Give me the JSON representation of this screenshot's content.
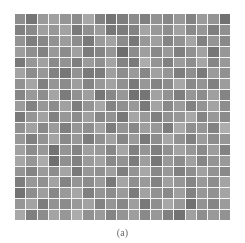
{
  "figure": {
    "caption": "(a)",
    "panel_label": "(a)",
    "background_color": "#ffffff",
    "grid_line_color": "#f4f4f4",
    "panel_bounds": {
      "x": 15,
      "y": 14,
      "width": 215,
      "height": 206
    }
  },
  "chart_data": {
    "type": "heatmap",
    "title": "(a)",
    "subtitle": "",
    "xlabel": "",
    "ylabel": "",
    "colormap": "gray",
    "grid": true,
    "legend": "none",
    "rows": 19,
    "cols": 19,
    "value_range": [
      0,
      255
    ],
    "xlim": [
      0,
      19
    ],
    "ylim": [
      0,
      19
    ],
    "x_tick_labels": [],
    "y_tick_labels": [],
    "annotations": [],
    "cell_hex": [
      [
        "#9b9b9b",
        "#808080",
        "#a8a8a8",
        "#b0b0b0",
        "#a3a3a3",
        "#9a9a9a",
        "#b7b7b7",
        "#8e8e8e",
        "#7f7f7f",
        "#8a8a8a",
        "#999999",
        "#8c8c8c",
        "#a0a0a0",
        "#949494",
        "#a6a6a6",
        "#8f8f8f",
        "#a9a9a9",
        "#a2a2a2",
        "#7c7c7c"
      ],
      [
        "#8d8d8d",
        "#969696",
        "#afafaf",
        "#a5a5a5",
        "#b2b2b2",
        "#868686",
        "#9d9d9d",
        "#aaaaaa",
        "#828282",
        "#888888",
        "#909090",
        "#b4b4b4",
        "#a7a7a7",
        "#9c9c9c",
        "#b1b1b1",
        "#979797",
        "#a4a4a4",
        "#8b8b8b",
        "#9e9e9e"
      ],
      [
        "#a1a1a1",
        "#8a8a8a",
        "#949494",
        "#9f9f9f",
        "#ababab",
        "#9b9b9b",
        "#858585",
        "#a9a9a9",
        "#b3b3b3",
        "#989898",
        "#838383",
        "#a6a6a6",
        "#adadad",
        "#929292",
        "#a0a0a0",
        "#b5b5b5",
        "#8e8e8e",
        "#a3a3a3",
        "#969696"
      ],
      [
        "#acacac",
        "#9d9d9d",
        "#8f8f8f",
        "#a7a7a7",
        "#999999",
        "#b0b0b0",
        "#878787",
        "#929292",
        "#a4a4a4",
        "#787878",
        "#9a9a9a",
        "#aeaeae",
        "#959595",
        "#a8a8a8",
        "#8c8c8c",
        "#9f9f9f",
        "#b2b2b2",
        "#818181",
        "#a5a5a5"
      ],
      [
        "#848484",
        "#a5a5a5",
        "#b1b1b1",
        "#979797",
        "#a0a0a0",
        "#8b8b8b",
        "#a9a9a9",
        "#9e9e9e",
        "#b4b4b4",
        "#909090",
        "#868686",
        "#bcbcbc",
        "#a2a2a2",
        "#8d8d8d",
        "#aaaaaa",
        "#9c9c9c",
        "#b6b6b6",
        "#939393",
        "#a7a7a7"
      ],
      [
        "#b3b3b3",
        "#9a9a9a",
        "#a6a6a6",
        "#8e8e8e",
        "#828282",
        "#a1a1a1",
        "#858585",
        "#898989",
        "#afafaf",
        "#9b9b9b",
        "#a8a8a8",
        "#949494",
        "#b0b0b0",
        "#a4a4a4",
        "#8a8a8a",
        "#9d9d9d",
        "#868686",
        "#a9a9a9",
        "#9f9f9f"
      ],
      [
        "#a0a0a0",
        "#b5b5b5",
        "#8c8c8c",
        "#a3a3a3",
        "#989898",
        "#adadad",
        "#919191",
        "#a7a7a7",
        "#b2b2b2",
        "#9e9e9e",
        "#848484",
        "#a5a5a5",
        "#8f8f8f",
        "#9a9a9a",
        "#b7b7b7",
        "#969696",
        "#a2a2a2",
        "#8d8d8d",
        "#abab ab"
      ],
      [
        "#939393",
        "#a8a8a8",
        "#9c9c9c",
        "#b4b4b4",
        "#878787",
        "#9f9f9f",
        "#aeaeae",
        "#828282",
        "#959595",
        "#a6a6a6",
        "#7d7d7d",
        "#808080",
        "#b1b1b1",
        "#a0a0a0",
        "#8b8b8b",
        "#a4a4a4",
        "#999999",
        "#afafaf",
        "#919191"
      ],
      [
        "#aaaaaa",
        "#8f8f8f",
        "#a5a5a5",
        "#999999",
        "#b0b0b0",
        "#8a8a8a",
        "#a2a2a2",
        "#b6b6b6",
        "#909090",
        "#9d9d9d",
        "#a7a7a7",
        "#858585",
        "#b3b3b3",
        "#969696",
        "#a9a9a9",
        "#8e8e8e",
        "#a1a1a1",
        "#b2b2b2",
        "#9b9b9b"
      ],
      [
        "#868686",
        "#a3a3a3",
        "#b2b2b2",
        "#8d8d8d",
        "#a6a6a6",
        "#9a9a9a",
        "#aeaeae",
        "#949494",
        "#a0a0a0",
        "#838383",
        "#b5b5b5",
        "#a8a8a8",
        "#8c8c8c",
        "#9f9f9f",
        "#a5a5a5",
        "#b8b8b8",
        "#929292",
        "#a7a7a7",
        "#989898"
      ],
      [
        "#9e9e9e",
        "#b0b0b0",
        "#969696",
        "#a9a9a9",
        "#8b8b8b",
        "#a4a4a4",
        "#9c9c9c",
        "#b3b3b3",
        "#888888",
        "#a1a1a1",
        "#959595",
        "#adadad",
        "#a6a6a6",
        "#8a8a8a",
        "#b9b9b9",
        "#9d9d9d",
        "#a3a3a3",
        "#8f8f8f",
        "#bdbdbd"
      ],
      [
        "#a7a7a7",
        "#8c8c8c",
        "#a1a1a1",
        "#b4b4b4",
        "#979797",
        "#a5a5a5",
        "#898989",
        "#9f9f9f",
        "#b1b1b1",
        "#939393",
        "#a9a9a9",
        "#848484",
        "#9b9b9b",
        "#b6b6b6",
        "#a0a0a0",
        "#8e8e8e",
        "#aaaaaa",
        "#9a9a9a",
        "#a4a4a4"
      ],
      [
        "#b1b1b1",
        "#999999",
        "#a6a6a6",
        "#7e7e7e",
        "#a2a2a2",
        "#909090",
        "#adadad",
        "#a8a8a8",
        "#959595",
        "#b5b5b5",
        "#8d8d8d",
        "#a3a3a3",
        "#8a8a8a",
        "#9e9e9e",
        "#b2b2b2",
        "#a5a5a5",
        "#979797",
        "#ababab",
        "#8f8f8f"
      ],
      [
        "#b6b6b6",
        "#a4a4a4",
        "#bababa",
        "#7a7a7a",
        "#9d9d9d",
        "#8e8e8e",
        "#a9a9a9",
        "#b3b3b3",
        "#969696",
        "#a0a0a0",
        "#888888",
        "#aeaeae",
        "#828282",
        "#a7a7a7",
        "#9a9a9a",
        "#b0b0b0",
        "#939393",
        "#a2a2a2",
        "#a8a8a8"
      ],
      [
        "#a2a2a2",
        "#919191",
        "#a9a9a9",
        "#9b9b9b",
        "#b4b4b4",
        "#868686",
        "#a5a5a5",
        "#9f9f9f",
        "#afafaf",
        "#8b8b8b",
        "#a1a1a1",
        "#b7b7b7",
        "#959595",
        "#a6a6a6",
        "#8d8d8d",
        "#9c9c9c",
        "#b1b1b1",
        "#a0a0a0",
        "#969696"
      ],
      [
        "#8a8a8a",
        "#a6a6a6",
        "#9e9e9e",
        "#b2b2b2",
        "#909090",
        "#a3a3a3",
        "#999999",
        "#aaaaaa",
        "#858585",
        "#b5b5b5",
        "#9d9d9d",
        "#a8a8a8",
        "#8f8f8f",
        "#b0b0b0",
        "#a4a4a4",
        "#929292",
        "#a7a7a7",
        "#9b9b9b",
        "#b3b3b3"
      ],
      [
        "#7f7f7f",
        "#9c9c9c",
        "#adadad",
        "#949494",
        "#a8a8a8",
        "#b6b6b6",
        "#8c8c8c",
        "#a2a2a2",
        "#9a9a9a",
        "#a9a9a9",
        "#878787",
        "#b2b2b2",
        "#a0a0a0",
        "#969696",
        "#aeaeae",
        "#8e8e8e",
        "#a5a5a5",
        "#9f9f9f",
        "#b4b4b4"
      ],
      [
        "#a4a4a4",
        "#b3b3b3",
        "#898989",
        "#a0a0a0",
        "#989898",
        "#a7a7a7",
        "#b1b1b1",
        "#8f8f8f",
        "#a3a3a3",
        "#9494 94",
        "#acacac",
        "#848484",
        "#9d9d9d",
        "#b7b7b7",
        "#a6a6a6",
        "#7b7b7b",
        "#a1a1a1",
        "#939393",
        "#aaaaaa"
      ],
      [
        "#b8b8b8",
        "#8b8b8b",
        "#9a9a9a",
        "#b4b4b4",
        "#a5a5a5",
        "#bcbcbc",
        "#9f9f9f",
        "#a9a9a9",
        "#919191",
        "#a2a2a2",
        "#adadad",
        "#969696",
        "#a6a6a6",
        "#8d8d8d",
        "#7e7e7e",
        "#b0b0b0",
        "#9c9c9c",
        "#a8a8a8",
        "#a0a0a0"
      ]
    ]
  }
}
